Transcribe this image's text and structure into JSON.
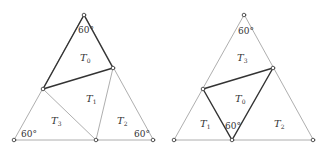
{
  "figures": [
    {
      "name": "left-figure",
      "regions": [
        {
          "label": "T",
          "sub": "0",
          "x": 80,
          "y": 61
        },
        {
          "label": "T",
          "sub": "1",
          "x": 86,
          "y": 102
        },
        {
          "label": "T",
          "sub": "3",
          "x": 51,
          "y": 124
        },
        {
          "label": "T",
          "sub": "2",
          "x": 117,
          "y": 124
        }
      ],
      "angles": [
        {
          "text": "60°",
          "x": 78,
          "y": 33
        },
        {
          "text": "60°",
          "x": 21,
          "y": 137
        },
        {
          "text": "60°",
          "x": 134,
          "y": 137
        }
      ]
    },
    {
      "name": "right-figure",
      "regions": [
        {
          "label": "T",
          "sub": "3",
          "x": 237,
          "y": 61
        },
        {
          "label": "T",
          "sub": "0",
          "x": 235,
          "y": 102
        },
        {
          "label": "T",
          "sub": "1",
          "x": 200,
          "y": 127
        },
        {
          "label": "T",
          "sub": "2",
          "x": 274,
          "y": 127
        }
      ],
      "angles": [
        {
          "text": "60°",
          "x": 238,
          "y": 34
        },
        {
          "text": "60°",
          "x": 225,
          "y": 129
        }
      ]
    }
  ]
}
